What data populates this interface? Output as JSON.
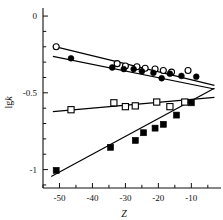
{
  "chart_data": {
    "type": "scatter",
    "title": "",
    "xlabel": "Z",
    "ylabel": "lgk",
    "xlim": [
      -55,
      -1
    ],
    "ylim": [
      -1.12,
      0.02
    ],
    "grid": false,
    "legend_position": "none",
    "x_ticks": [
      -50,
      -40,
      -30,
      -20,
      -10
    ],
    "x_tick_labels": [
      "-50",
      "-40",
      "-30",
      "-20",
      "-10"
    ],
    "y_ticks": [
      0,
      -0.5,
      -1
    ],
    "y_tick_labels": [
      "0",
      "-0.5",
      "-1"
    ],
    "y_minor_step": 0.1,
    "x_minor_step": 5,
    "convergence_point": {
      "x": -4.0,
      "y": -0.48
    },
    "series": [
      {
        "name": "open-circles",
        "marker": "open-circle",
        "color": "#000000",
        "points": [
          {
            "x": -51.0,
            "y": -0.2
          },
          {
            "x": -32.5,
            "y": -0.31
          },
          {
            "x": -30.0,
            "y": -0.325
          },
          {
            "x": -26.5,
            "y": -0.33
          },
          {
            "x": -24.0,
            "y": -0.34
          },
          {
            "x": -21.0,
            "y": -0.345
          },
          {
            "x": -18.5,
            "y": -0.355
          },
          {
            "x": -16.0,
            "y": -0.365
          },
          {
            "x": -11.0,
            "y": -0.355
          }
        ],
        "fit_line": {
          "x1": -52.0,
          "y1": -0.196,
          "x2": -3.0,
          "y2": -0.452
        }
      },
      {
        "name": "filled-circles",
        "marker": "filled-circle",
        "color": "#000000",
        "points": [
          {
            "x": -46.5,
            "y": -0.275
          },
          {
            "x": -34.0,
            "y": -0.335
          },
          {
            "x": -30.5,
            "y": -0.345
          },
          {
            "x": -27.5,
            "y": -0.345
          },
          {
            "x": -25.0,
            "y": -0.36
          },
          {
            "x": -21.5,
            "y": -0.37
          },
          {
            "x": -19.0,
            "y": -0.405
          },
          {
            "x": -16.5,
            "y": -0.375
          },
          {
            "x": -13.0,
            "y": -0.39
          },
          {
            "x": -8.5,
            "y": -0.395
          }
        ],
        "fit_line": {
          "x1": -52.0,
          "y1": -0.262,
          "x2": -3.0,
          "y2": -0.475
        }
      },
      {
        "name": "open-squares",
        "marker": "open-square",
        "color": "#000000",
        "points": [
          {
            "x": -46.5,
            "y": -0.61
          },
          {
            "x": -33.5,
            "y": -0.565
          },
          {
            "x": -30.0,
            "y": -0.59
          },
          {
            "x": -27.0,
            "y": -0.585
          },
          {
            "x": -20.5,
            "y": -0.56
          },
          {
            "x": -16.5,
            "y": -0.59
          },
          {
            "x": -12.0,
            "y": -0.56
          }
        ],
        "fit_line": {
          "x1": -52.0,
          "y1": -0.622,
          "x2": -3.0,
          "y2": -0.53
        }
      },
      {
        "name": "filled-squares",
        "marker": "filled-square",
        "color": "#000000",
        "points": [
          {
            "x": -51.0,
            "y": -1.005
          },
          {
            "x": -34.5,
            "y": -0.855
          },
          {
            "x": -27.0,
            "y": -0.81
          },
          {
            "x": -24.5,
            "y": -0.76
          },
          {
            "x": -21.0,
            "y": -0.73
          },
          {
            "x": -18.5,
            "y": -0.705
          },
          {
            "x": -14.5,
            "y": -0.645
          },
          {
            "x": -10.0,
            "y": -0.565
          }
        ],
        "fit_line": {
          "x1": -52.5,
          "y1": -1.045,
          "x2": -3.0,
          "y2": -0.47
        }
      }
    ]
  }
}
